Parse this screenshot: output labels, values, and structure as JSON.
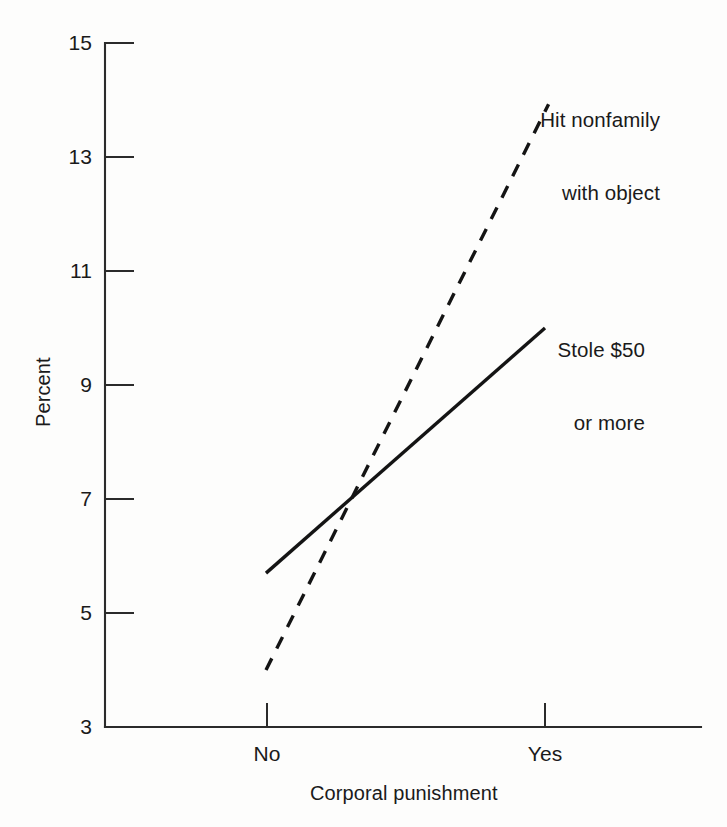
{
  "chart_data": {
    "type": "line",
    "title": "",
    "xlabel": "Corporal punishment",
    "ylabel": "Percent",
    "categories": [
      "No",
      "Yes"
    ],
    "x_tick_labels": [
      "No",
      "Yes"
    ],
    "y_tick_labels": [
      "15",
      "13",
      "11",
      "9",
      "7",
      "5",
      "3"
    ],
    "y_ticks": [
      15,
      13,
      11,
      9,
      7,
      5,
      3
    ],
    "ylim": [
      3,
      15
    ],
    "grid": false,
    "legend_position": "inline-annotation",
    "series": [
      {
        "name": "Hit nonfamily with object",
        "style": "dashed",
        "values": [
          4.0,
          13.8
        ],
        "label_line1": "Hit nonfamily",
        "label_line2": "with object"
      },
      {
        "name": "Stole $50 or more",
        "style": "solid",
        "values": [
          5.7,
          10.0
        ],
        "label_line1": "Stole $50",
        "label_line2": "or more"
      }
    ],
    "colors": {
      "line": "#141414",
      "axis": "#2b2b2b",
      "background": "#fdfdfc"
    }
  },
  "axes": {
    "y_title": "Percent",
    "x_title": "Corporal punishment",
    "y_tick_0": "15",
    "y_tick_1": "13",
    "y_tick_2": "11",
    "y_tick_3": "9",
    "y_tick_4": "7",
    "y_tick_5": "5",
    "y_tick_6": "3",
    "x_tick_0": "No",
    "x_tick_1": "Yes"
  },
  "annotations": {
    "dashed_line1": "Hit nonfamily",
    "dashed_line2": "with object",
    "solid_line1": "Stole $50",
    "solid_line2": "or more"
  }
}
